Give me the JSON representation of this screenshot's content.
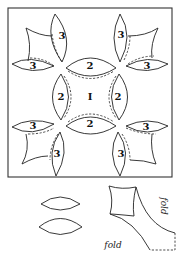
{
  "diagram": {
    "type": "quilt-block-pattern",
    "border": {
      "x": 8,
      "y": 8,
      "width": 164,
      "height": 169
    },
    "center_label": "I",
    "arc_labels": {
      "top": "2",
      "left": "2",
      "right": "2",
      "bottom": "2"
    },
    "petal_labels": {
      "tl_upper": "3",
      "tl_lower": "3",
      "tr_upper": "3",
      "tr_lower": "3",
      "bl_upper": "3",
      "bl_lower": "3",
      "br_upper": "3",
      "br_lower": "3"
    },
    "templates": {
      "melon_count": 2,
      "corner_piece_labels": {
        "side": "fold",
        "bottom": "fold"
      }
    },
    "colors": {
      "line": "#222222",
      "background": "#ffffff"
    }
  }
}
